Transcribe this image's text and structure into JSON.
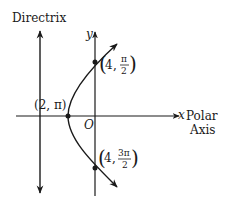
{
  "diagram": {
    "labels": {
      "directrix": "Directrix",
      "y_axis": "y",
      "x_axis": "x",
      "polar": "Polar",
      "axis": "Axis",
      "origin": "O"
    },
    "points": [
      {
        "name": "vertex",
        "label": "(2, π)",
        "r": "2",
        "theta": "π"
      },
      {
        "name": "top",
        "label_r": "4",
        "theta_num": "π",
        "theta_den": "2"
      },
      {
        "name": "bottom",
        "label_r": "4",
        "theta_num": "3π",
        "theta_den": "2"
      }
    ],
    "colors": {
      "line": "#1a1a1a",
      "background": "#ffffff"
    }
  }
}
